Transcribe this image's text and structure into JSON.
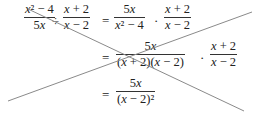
{
  "equation": {
    "line1": {
      "lhs_frac1": {
        "num": "x² − 4",
        "den": "5x"
      },
      "op_divide": "÷",
      "lhs_frac2": {
        "num": "x + 2",
        "den": "x − 2"
      },
      "equals": "=",
      "rhs_frac1": {
        "num": "5x",
        "den": "x² − 4"
      },
      "op_dot": "·",
      "rhs_frac2": {
        "num": "x + 2",
        "den": "x − 2"
      }
    },
    "line2": {
      "equals": "=",
      "frac1": {
        "num": "5x",
        "den": "(x + 2)(x − 2)"
      },
      "op_dot": "·",
      "frac2": {
        "num": "x + 2",
        "den": "x − 2"
      }
    },
    "line3": {
      "equals": "=",
      "frac1": {
        "num": "5x",
        "den": "(x − 2)²"
      }
    }
  },
  "overlay": {
    "type": "cross-out lines",
    "color": "#8a8a8a"
  }
}
